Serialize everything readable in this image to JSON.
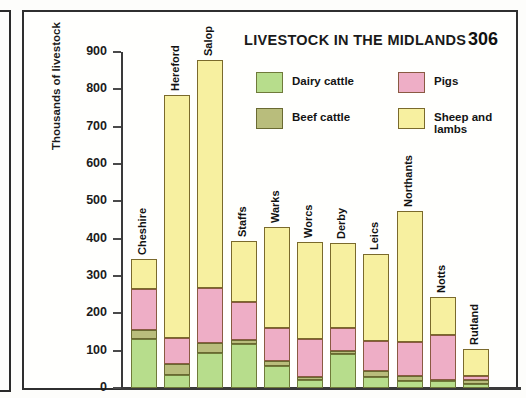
{
  "figure": {
    "title": "LIVESTOCK IN  THE MIDLANDS",
    "number": "306"
  },
  "legend": {
    "items": [
      {
        "key": "dairy",
        "label": "Dairy cattle",
        "color": "#b7dd8c"
      },
      {
        "key": "beef",
        "label": "Beef cattle",
        "color": "#b9bd7c"
      },
      {
        "key": "pigs",
        "label": "Pigs",
        "color": "#eeaec6"
      },
      {
        "key": "sheep",
        "label": "Sheep and\nlambs",
        "color": "#f7f0a0"
      }
    ]
  },
  "chart_data": {
    "type": "bar",
    "stacked": true,
    "title": "LIVESTOCK IN  THE MIDLANDS",
    "xlabel": "",
    "ylabel": "Thousands of livestock",
    "ylim": [
      0,
      900
    ],
    "ytick_step": 100,
    "yticks": [
      "900",
      "800",
      "700",
      "600",
      "500",
      "400",
      "300",
      "200",
      "100",
      "0"
    ],
    "grid": false,
    "legend_position": "top-center",
    "categories": [
      "Cheshire",
      "Hereford",
      "Salop",
      "Staffs",
      "Warks",
      "Worcs",
      "Derby",
      "Leics",
      "Northants",
      "Notts",
      "Rutland"
    ],
    "series": [
      {
        "name": "Dairy cattle",
        "key": "dairy",
        "color": "#b7dd8c",
        "values": [
          130,
          35,
          93,
          117,
          59,
          22,
          91,
          30,
          20,
          20,
          10
        ]
      },
      {
        "name": "Beef cattle",
        "key": "beef",
        "color": "#b9bd7c",
        "values": [
          25,
          28,
          27,
          11,
          13,
          8,
          9,
          15,
          13,
          2,
          12
        ]
      },
      {
        "name": "Pigs",
        "key": "pigs",
        "color": "#eeaec6",
        "values": [
          110,
          70,
          148,
          102,
          89,
          100,
          60,
          80,
          89,
          120,
          11
        ]
      },
      {
        "name": "Sheep and lambs",
        "key": "sheep",
        "color": "#f7f0a0",
        "values": [
          80,
          652,
          610,
          165,
          269,
          260,
          229,
          235,
          353,
          103,
          72
        ]
      }
    ],
    "totals": [
      345,
      785,
      878,
      395,
      430,
      390,
      389,
      360,
      475,
      245,
      105
    ]
  }
}
